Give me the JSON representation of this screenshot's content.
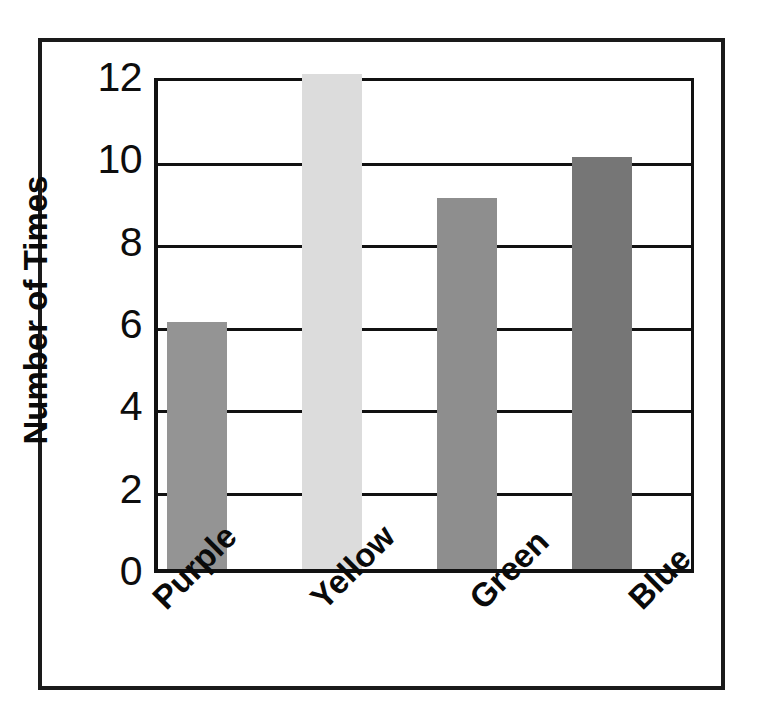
{
  "figure": {
    "frame_color": "#1a1a1a",
    "background": "#ffffff"
  },
  "chart_data": {
    "type": "bar",
    "title": "",
    "xlabel": "",
    "ylabel": "Number of Times",
    "categories": [
      "Purple",
      "Yellow",
      "Green",
      "Blue"
    ],
    "values": [
      6,
      12,
      9,
      10
    ],
    "ylim": [
      0,
      12
    ],
    "yticks": [
      0,
      2,
      4,
      6,
      8,
      10,
      12
    ],
    "ytick_labels": [
      "0",
      "2",
      "4",
      "6",
      "8",
      "10",
      "12"
    ],
    "grid": true,
    "grid_axis": "y",
    "legend": false,
    "bar_colors": [
      "#949494",
      "#dcdcdc",
      "#8e8e8e",
      "#767676"
    ],
    "series": [
      {
        "name": "Number of Times",
        "values": [
          6,
          12,
          9,
          10
        ]
      }
    ]
  },
  "axis": {
    "y_title": "Number of Times",
    "tick_0": "0",
    "tick_2": "2",
    "tick_4": "4",
    "tick_6": "6",
    "tick_8": "8",
    "tick_10": "10",
    "tick_12": "12"
  },
  "categories": {
    "purple": "Purple",
    "yellow": "Yellow",
    "green": "Green",
    "blue": "Blue"
  }
}
